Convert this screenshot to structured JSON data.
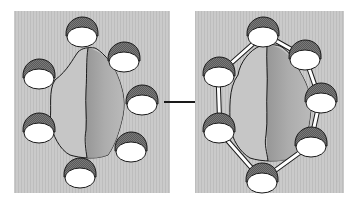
{
  "figure": {
    "panels": [
      {
        "id": "before",
        "label": "",
        "particle_count": 8,
        "linked": false
      },
      {
        "id": "after",
        "label": "",
        "particle_count": 8,
        "linked": true
      }
    ],
    "arrow": {
      "direction": "right",
      "meaning": "transition"
    },
    "colors": {
      "background_panel": "#c9c9c9",
      "body_light": "#c4c4c4",
      "body_dark": "#9a9a9a",
      "particle_cap": "#6e6e6e",
      "particle_face": "#ffffff",
      "outline": "#1a1a1a"
    }
  }
}
